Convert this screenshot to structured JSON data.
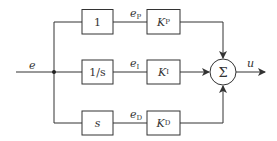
{
  "diagram": {
    "input": {
      "label": "e"
    },
    "output": {
      "label": "u"
    },
    "rows": [
      {
        "block": "1",
        "signal": "e",
        "signal_sub": "P",
        "gain": "K",
        "gain_sub": "P"
      },
      {
        "block": "1/s",
        "signal": "e",
        "signal_sub": "I",
        "gain": "K",
        "gain_sub": "I"
      },
      {
        "block": "s",
        "signal": "e",
        "signal_sub": "D",
        "gain": "K",
        "gain_sub": "D"
      }
    ],
    "summer": {
      "symbol": "Σ"
    },
    "colors": {
      "stroke": "#333333",
      "background": "#ffffff"
    }
  }
}
